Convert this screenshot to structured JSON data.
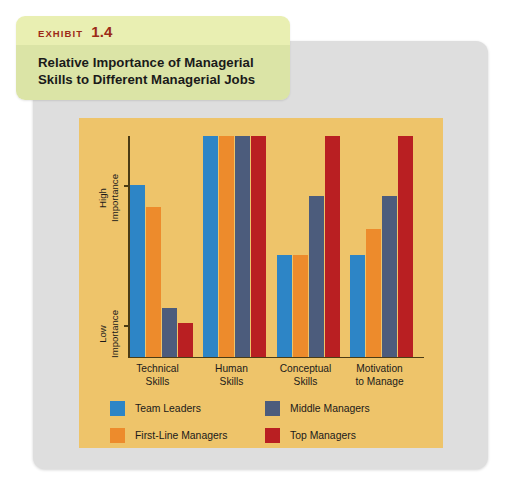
{
  "exhibit": {
    "kicker_word": "EXHIBIT",
    "number": "1.4",
    "title_line1": "Relative Importance of Managerial",
    "title_line2": "Skills to Different Managerial Jobs"
  },
  "axis": {
    "y_high_line1": "High",
    "y_high_line2": "Importance",
    "y_low_line1": "Low",
    "y_low_line2": "Importance"
  },
  "categories_display": [
    {
      "line1": "Technical",
      "line2": "Skills"
    },
    {
      "line1": "Human",
      "line2": "Skills"
    },
    {
      "line1": "Conceptual",
      "line2": "Skills"
    },
    {
      "line1": "Motivation",
      "line2": "to Manage"
    }
  ],
  "legend": [
    {
      "label": "Team Leaders",
      "color": "#2d85c6"
    },
    {
      "label": "Middle Managers",
      "color": "#4c5c7c"
    },
    {
      "label": "First-Line Managers",
      "color": "#ed8b2c"
    },
    {
      "label": "Top Managers",
      "color": "#b91f22"
    }
  ],
  "colors": {
    "panel_gray": "#dedede",
    "chart_tan": "#eec46a",
    "badge_light": "#e9efb2",
    "badge_dark": "#dbe4a6",
    "exhibit_red": "#9c2a17",
    "axis": "#4a3b14"
  },
  "chart_data": {
    "type": "bar",
    "title": "Relative Importance of Managerial Skills to Different Managerial Jobs",
    "xlabel": "",
    "ylabel": "Importance",
    "ylim": [
      0,
      100
    ],
    "grid": false,
    "legend_position": "bottom",
    "ytick_labels": [
      "Low Importance",
      "High Importance"
    ],
    "ytick_values": [
      15,
      78
    ],
    "categories": [
      "Technical Skills",
      "Human Skills",
      "Conceptual Skills",
      "Motivation to Manage"
    ],
    "series": [
      {
        "name": "Team Leaders",
        "color": "#2d85c6",
        "values": [
          78,
          100,
          46,
          46
        ]
      },
      {
        "name": "First-Line Managers",
        "color": "#ed8b2c",
        "values": [
          68,
          100,
          46,
          58
        ]
      },
      {
        "name": "Middle Managers",
        "color": "#4c5c7c",
        "values": [
          22,
          100,
          73,
          73
        ]
      },
      {
        "name": "Top Managers",
        "color": "#b91f22",
        "values": [
          15,
          100,
          100,
          100
        ]
      }
    ]
  }
}
